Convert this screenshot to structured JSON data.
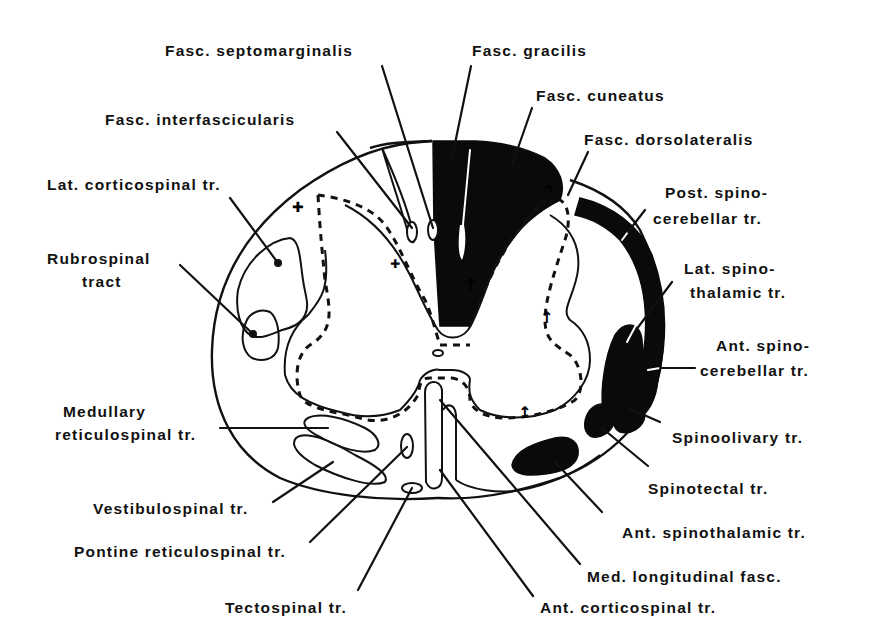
{
  "diagram": {
    "colors": {
      "ink": "#111111",
      "background": "#ffffff",
      "ascending_fill": "#0a0a0a"
    },
    "labels": {
      "fasc_septomarginalis": "Fasc. septomarginalis",
      "fasc_gracilis": "Fasc. gracilis",
      "fasc_cuneatus": "Fasc. cuneatus",
      "fasc_interfascicularis": "Fasc. interfascicularis",
      "fasc_dorsolateralis": "Fasc. dorsolateralis",
      "lat_corticospinal": "Lat. corticospinal tr.",
      "post_spinocerebellar_1": "Post. spino-",
      "post_spinocerebellar_2": "cerebellar tr.",
      "rubrospinal_1": "Rubrospinal",
      "rubrospinal_2": "tract",
      "lat_spinothalamic_1": "Lat. spino-",
      "lat_spinothalamic_2": "thalamic tr.",
      "ant_spinocerebellar_1": "Ant. spino-",
      "ant_spinocerebellar_2": "cerebellar tr.",
      "medullary_reticulospinal_1": "Medullary",
      "medullary_reticulospinal_2": "reticulospinal tr.",
      "spinoolivary": "Spinoolivary tr.",
      "vestibulospinal": "Vestibulospinal tr.",
      "spinotectal": "Spinotectal tr.",
      "pontine_reticulospinal": "Pontine reticulospinal tr.",
      "ant_spinothalamic": "Ant. spinothalamic tr.",
      "med_longitudinal_fasc": "Med. longitudinal fasc.",
      "tectospinal": "Tectospinal tr.",
      "ant_corticospinal": "Ant. corticospinal tr."
    }
  }
}
